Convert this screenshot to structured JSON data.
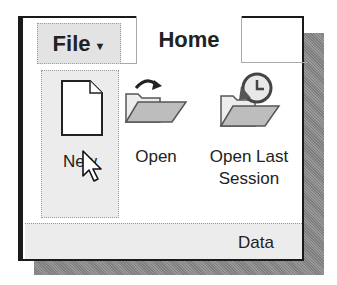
{
  "ribbon": {
    "tabs": [
      {
        "label": "File",
        "has_dropdown": true,
        "dropdown_glyph": "▼"
      },
      {
        "label": "Home",
        "active": true
      }
    ],
    "buttons": [
      {
        "id": "new",
        "label": "New",
        "icon": "new-document-icon",
        "hovered": true
      },
      {
        "id": "open",
        "label": "Open",
        "icon": "open-folder-icon"
      },
      {
        "id": "open-last-session",
        "label_line1": "Open Last",
        "label_line2": "Session",
        "icon": "open-last-session-icon"
      }
    ],
    "panel_label": "Data"
  },
  "colors": {
    "frame_border": "#1a1a1a",
    "tab_file_bg": "#e3e3e3",
    "hover_bg": "#ececec",
    "shadow": "#8a8a8a",
    "folder": "#c8c8c8"
  }
}
